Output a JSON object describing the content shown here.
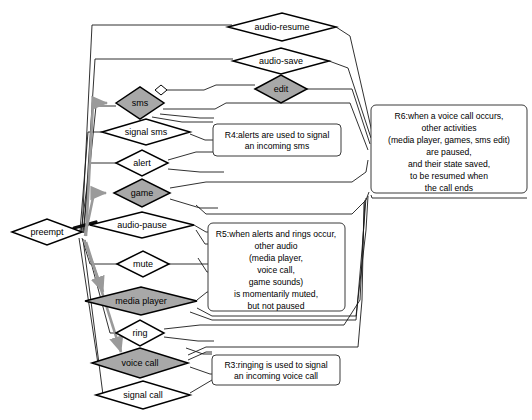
{
  "diagram": {
    "colors": {
      "node_fill_highlight": "#a8a8a8",
      "node_fill_plain": "#ffffff",
      "node_stroke": "#000000",
      "edge_stroke": "#1a1a1a",
      "edge_highlight_stroke": "#9a9a9a",
      "note_stroke": "#3b3b3b",
      "background": "#ffffff"
    },
    "nodes": [
      {
        "id": "audio-resume",
        "label": "audio-resume",
        "shape": "diamond",
        "fill": "plain",
        "cx": 282,
        "cy": 27,
        "rx": 54,
        "ry": 14
      },
      {
        "id": "audio-save",
        "label": "audio-save",
        "shape": "diamond",
        "fill": "plain",
        "cx": 281,
        "cy": 61,
        "rx": 48,
        "ry": 13
      },
      {
        "id": "edit",
        "label": "edit",
        "shape": "diamond",
        "fill": "highlight",
        "cx": 281,
        "cy": 89,
        "rx": 26,
        "ry": 14
      },
      {
        "id": "sms",
        "label": "sms",
        "shape": "diamond",
        "fill": "highlight",
        "cx": 140,
        "cy": 103,
        "rx": 24,
        "ry": 16
      },
      {
        "id": "sms-port",
        "label": "",
        "shape": "diamond-tiny",
        "fill": "plain",
        "cx": 161,
        "cy": 90,
        "rx": 6,
        "ry": 5
      },
      {
        "id": "signal-sms",
        "label": "signal sms",
        "shape": "diamond",
        "fill": "plain",
        "cx": 146,
        "cy": 132,
        "rx": 44,
        "ry": 13
      },
      {
        "id": "alert",
        "label": "alert",
        "shape": "diamond",
        "fill": "plain",
        "cx": 142,
        "cy": 163,
        "rx": 26,
        "ry": 13
      },
      {
        "id": "game",
        "label": "game",
        "shape": "diamond",
        "fill": "highlight",
        "cx": 142,
        "cy": 193,
        "rx": 28,
        "ry": 14
      },
      {
        "id": "preempt",
        "label": "preempt",
        "shape": "diamond",
        "fill": "plain",
        "cx": 47,
        "cy": 232,
        "rx": 35,
        "ry": 13
      },
      {
        "id": "audio-pause",
        "label": "audio-pause",
        "shape": "diamond",
        "fill": "plain",
        "cx": 142,
        "cy": 225,
        "rx": 52,
        "ry": 13
      },
      {
        "id": "mute",
        "label": "mute",
        "shape": "diamond",
        "fill": "plain",
        "cx": 143,
        "cy": 264,
        "rx": 26,
        "ry": 13
      },
      {
        "id": "media-player",
        "label": "media player",
        "shape": "diamond",
        "fill": "highlight",
        "cx": 141,
        "cy": 301,
        "rx": 56,
        "ry": 14
      },
      {
        "id": "ring",
        "label": "ring",
        "shape": "diamond",
        "fill": "plain",
        "cx": 140,
        "cy": 333,
        "rx": 24,
        "ry": 13
      },
      {
        "id": "voice-call",
        "label": "voice call",
        "shape": "diamond",
        "fill": "highlight",
        "cx": 140,
        "cy": 363,
        "rx": 48,
        "ry": 15
      },
      {
        "id": "signal-call",
        "label": "signal call",
        "shape": "diamond",
        "fill": "plain",
        "cx": 143,
        "cy": 395,
        "rx": 47,
        "ry": 14
      }
    ],
    "notes": [
      {
        "id": "R4",
        "x": 213,
        "y": 124,
        "w": 128,
        "h": 32,
        "lines": [
          "R4:alerts are used to signal",
          "an incoming sms"
        ]
      },
      {
        "id": "R6",
        "x": 371,
        "y": 105,
        "w": 156,
        "h": 88,
        "lines": [
          "R6:when a voice call occurs,",
          "other activities",
          "(media player, games, sms edit)",
          "are paused,",
          "and their state saved,",
          "to be resumed when",
          "the call ends"
        ]
      },
      {
        "id": "R5",
        "x": 208,
        "y": 223,
        "w": 137,
        "h": 88,
        "lines": [
          "R5:when alerts and rings occur,",
          "other audio",
          "(media player,",
          "voice call,",
          "game sounds)",
          "is momentarily muted,",
          "but not paused"
        ]
      },
      {
        "id": "R3",
        "x": 212,
        "y": 355,
        "w": 128,
        "h": 30,
        "lines": [
          "R3:ringing is used to signal",
          "an incoming voice call"
        ]
      }
    ]
  }
}
